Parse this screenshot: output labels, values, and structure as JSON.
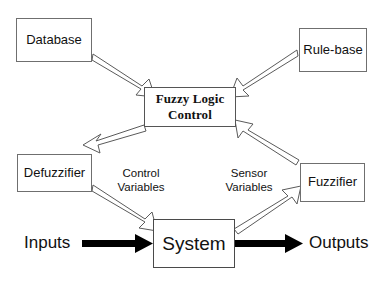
{
  "diagram": {
    "nodes": {
      "database": {
        "label": "Database"
      },
      "rule_base": {
        "label": "Rule-base"
      },
      "fuzzy_logic_control": {
        "label": "Fuzzy Logic\nControl"
      },
      "defuzzifier": {
        "label": "Defuzzifier"
      },
      "fuzzifier": {
        "label": "Fuzzifier"
      },
      "system": {
        "label": "System"
      }
    },
    "edge_labels": {
      "control_variables": "Control\nVariables",
      "sensor_variables": "Sensor\nVariables"
    },
    "io": {
      "inputs": "Inputs",
      "outputs": "Outputs"
    },
    "colors": {
      "background": "#ffffff",
      "box_border": "#6f6f6f",
      "text": "#111111",
      "hollow_arrow_stroke": "#5a5a5a",
      "hollow_arrow_fill": "#ffffff",
      "solid_arrow_fill": "#000000"
    }
  }
}
